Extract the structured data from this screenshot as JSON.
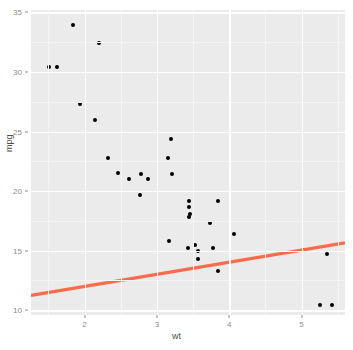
{
  "chart_data": {
    "type": "scatter",
    "title": "",
    "xlabel": "wt",
    "ylabel": "mpg",
    "xlim": [
      1.26,
      5.6
    ],
    "ylim": [
      9.6,
      35.2
    ],
    "xticks": [
      2,
      3,
      4,
      5
    ],
    "xtick_labels": [
      "2",
      "3",
      "4",
      "5"
    ],
    "yticks": [
      10,
      15,
      20,
      25,
      30,
      35
    ],
    "ytick_labels": [
      "10",
      "15",
      "20",
      "25",
      "30",
      "35"
    ],
    "grid": true,
    "legend": "none",
    "panel_background": "#ebebeb",
    "gridline_color": "#ffffff",
    "point_color": "#000000",
    "trend_line_color": "#fb6a4a",
    "x": [
      2.62,
      2.875,
      2.32,
      3.215,
      3.44,
      3.46,
      3.57,
      3.19,
      3.15,
      3.44,
      3.44,
      4.07,
      3.73,
      3.78,
      5.25,
      5.424,
      5.345,
      2.2,
      1.615,
      1.835,
      2.465,
      3.52,
      3.435,
      3.84,
      3.845,
      1.935,
      2.14,
      1.513,
      3.17,
      2.77,
      3.57,
      2.78
    ],
    "y": [
      21.0,
      21.0,
      22.8,
      21.4,
      18.7,
      18.1,
      14.3,
      24.4,
      22.8,
      19.2,
      17.8,
      16.4,
      17.3,
      15.2,
      10.4,
      10.4,
      14.7,
      32.4,
      30.4,
      33.9,
      21.5,
      15.5,
      15.2,
      13.3,
      19.2,
      27.3,
      26.0,
      30.4,
      15.8,
      19.7,
      15.0,
      21.4
    ],
    "trend_line": {
      "x_start": 1.26,
      "y_start": 11.25,
      "x_end": 5.6,
      "y_end": 15.65
    }
  }
}
